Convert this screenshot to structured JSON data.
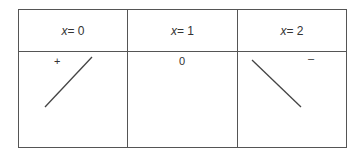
{
  "table": {
    "columns": [
      {
        "header_var": "x",
        "header_eq": " = 0",
        "sign": "+",
        "behavior": "increasing"
      },
      {
        "header_var": "x",
        "header_eq": " = 1",
        "sign": "0",
        "behavior": "constant"
      },
      {
        "header_var": "x",
        "header_eq": " = 2",
        "sign": "–",
        "behavior": "decreasing"
      }
    ]
  }
}
